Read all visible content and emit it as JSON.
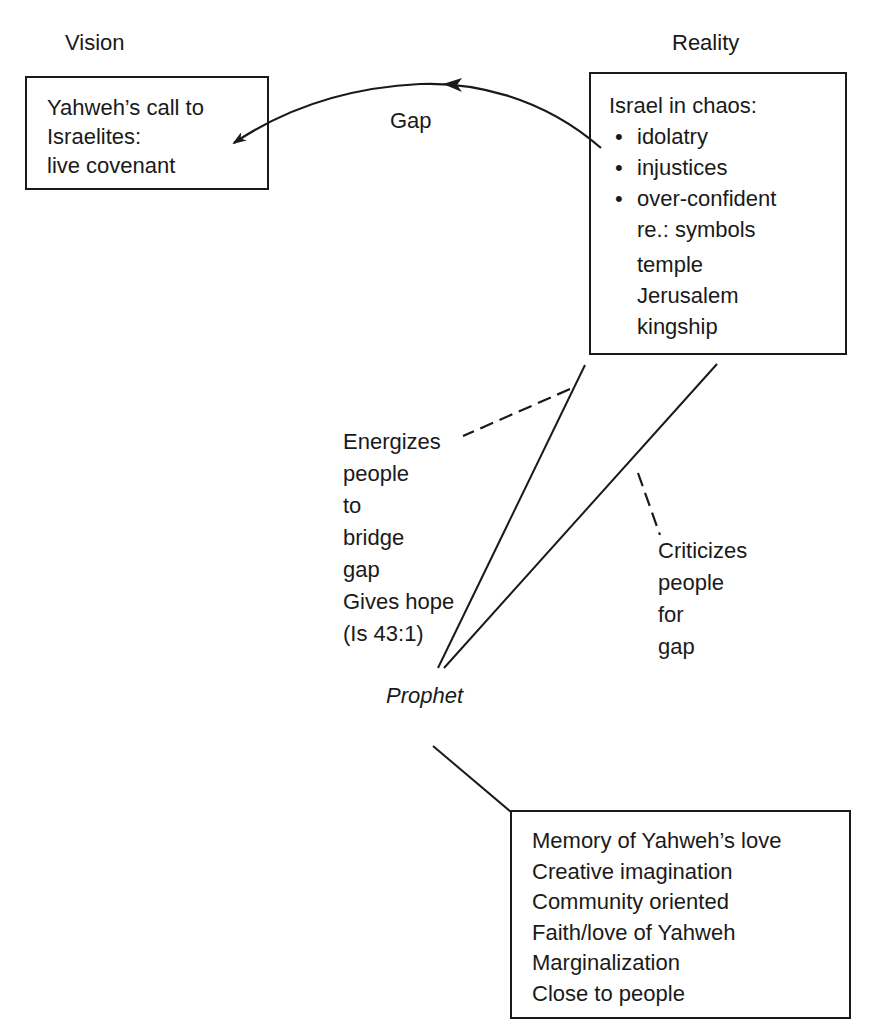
{
  "diagram": {
    "type": "concept-map",
    "headings": {
      "vision": "Vision",
      "reality": "Reality"
    },
    "vision_box": {
      "lines": [
        "Yahweh’s call to",
        "Israelites:",
        "live covenant"
      ]
    },
    "reality_box": {
      "heading": "Israel in chaos:",
      "bullets": [
        "idolatry",
        "injustices",
        "over-confident"
      ],
      "bullet_glyph": "•",
      "continuation": "re.: symbols",
      "symbols": [
        "temple",
        "Jerusalem",
        "kingship"
      ]
    },
    "gap_arrow": {
      "label": "Gap",
      "from": "reality_box",
      "to": "vision_box"
    },
    "energizes_annotation": {
      "lines": [
        "Energizes",
        "people",
        "to",
        "bridge",
        "gap",
        "Gives hope",
        "(Is 43:1)"
      ]
    },
    "criticizes_annotation": {
      "lines": [
        "Criticizes",
        "people",
        "for",
        "gap"
      ]
    },
    "prophet": {
      "label": "Prophet"
    },
    "traits_box": {
      "lines": [
        "Memory of Yahweh’s love",
        "Creative imagination",
        "Community oriented",
        "Faith/love of Yahweh",
        "Marginalization",
        "Close to people"
      ]
    },
    "colors": {
      "ink": "#1a1a1a",
      "background": "#ffffff"
    }
  }
}
